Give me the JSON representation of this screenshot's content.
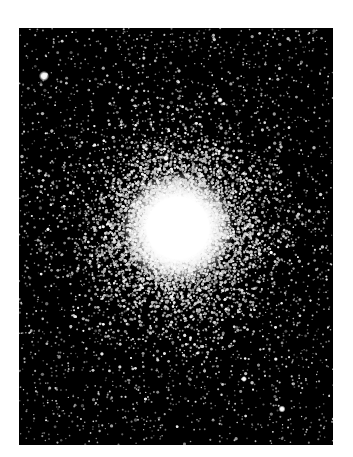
{
  "image": {
    "subject": "globular star cluster",
    "description": "Dense spherical cluster of stars with a saturated white core on a black starfield",
    "frame": {
      "x": 19,
      "y": 28,
      "width": 314,
      "height": 417
    },
    "core": {
      "cx": 159,
      "cy": 200,
      "saturated_radius": 35,
      "halo_radius": 125
    },
    "bright_stars": [
      {
        "x": 25,
        "y": 48,
        "r": 2.6
      },
      {
        "x": 147,
        "y": 130,
        "r": 1.6
      },
      {
        "x": 263,
        "y": 381,
        "r": 1.8
      },
      {
        "x": 225,
        "y": 351,
        "r": 1.5
      },
      {
        "x": 201,
        "y": 72,
        "r": 1.4
      }
    ],
    "colors": {
      "background": "#000000",
      "stars": "#ffffff",
      "page": "#ffffff"
    }
  }
}
